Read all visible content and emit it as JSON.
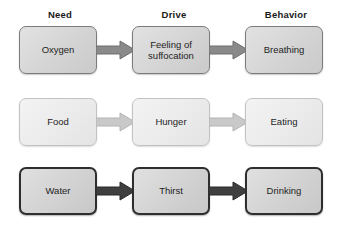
{
  "diagram": {
    "columns": [
      {
        "key": "need",
        "label": "Need"
      },
      {
        "key": "drive",
        "label": "Drive"
      },
      {
        "key": "behavior",
        "label": "Behavior"
      }
    ],
    "colors": {
      "background": "#ffffff",
      "text": "#1e1e1e",
      "header_text": "#1a1a1a",
      "row1_box_fill": "#d6d6d6",
      "row1_box_border": "#7b7b7b",
      "row1_arrow_fill": "#8a8a8a",
      "row2_box_fill": "#ededed",
      "row2_box_border": "#c2c2c2",
      "row2_arrow_fill": "#c9c9c9",
      "row3_box_fill": "#d2d2d2",
      "row3_box_border": "#2e2e2e",
      "row3_arrow_fill": "#3f3f3f"
    },
    "rows": [
      {
        "id": "row-oxygen",
        "need": "Oxygen",
        "drive": "Feeling of\nsuffocation",
        "behavior": "Breathing",
        "arrow_fill": "#8a8a8a",
        "arrow_stroke": "#6e6e6e"
      },
      {
        "id": "row-food",
        "need": "Food",
        "drive": "Hunger",
        "behavior": "Eating",
        "arrow_fill": "#c9c9c9",
        "arrow_stroke": "#b4b4b4"
      },
      {
        "id": "row-water",
        "need": "Water",
        "drive": "Thirst",
        "behavior": "Drinking",
        "arrow_fill": "#3f3f3f",
        "arrow_stroke": "#2b2b2b"
      }
    ]
  }
}
